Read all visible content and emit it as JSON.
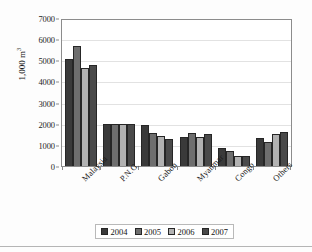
{
  "chart_data": {
    "type": "bar",
    "title": "",
    "subtitle": "",
    "xlabel": "",
    "ylabel": "1,000 m³",
    "ylabel_base": "1,000 m",
    "ylabel_sup": "3",
    "ylim": [
      0,
      7000
    ],
    "yticks": [
      0,
      1000,
      2000,
      3000,
      4000,
      5000,
      6000,
      7000
    ],
    "ytick_labels": [
      "0",
      "1000",
      "2000",
      "3000",
      "4000",
      "5000",
      "6000",
      "7000"
    ],
    "grid": "horizontal",
    "legend_position": "bottom",
    "categories": [
      "Malaysia",
      "P.N.G.",
      "Gabon",
      "Myanmar",
      "Congo",
      "Others"
    ],
    "series": [
      {
        "name": "2004",
        "color": "#3a3a3a",
        "values": [
          5130,
          2020,
          1950,
          1380,
          870,
          1340
        ]
      },
      {
        "name": "2005",
        "color": "#6e6e6e",
        "values": [
          5740,
          2020,
          1600,
          1570,
          740,
          1160
        ]
      },
      {
        "name": "2006",
        "color": "#b2b2b2",
        "values": [
          4680,
          2020,
          1450,
          1400,
          500,
          1540
        ]
      },
      {
        "name": "2007",
        "color": "#4a4a4a",
        "values": [
          4860,
          2020,
          1310,
          1520,
          460,
          1630
        ]
      }
    ]
  },
  "legend": {
    "entries": [
      {
        "label": "2004",
        "color": "#3a3a3a"
      },
      {
        "label": "2005",
        "color": "#6e6e6e"
      },
      {
        "label": "2006",
        "color": "#b2b2b2"
      },
      {
        "label": "2007",
        "color": "#4a4a4a"
      }
    ]
  },
  "axis": {
    "frame_color": "#8c8c8c",
    "gridline_color": "#e2e2e2"
  }
}
